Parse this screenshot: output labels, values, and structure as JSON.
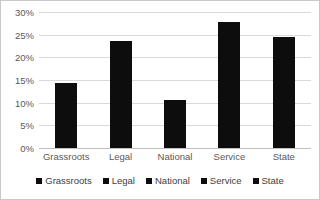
{
  "chart_data": {
    "type": "bar",
    "title": "",
    "xlabel": "",
    "ylabel": "",
    "categories": [
      "Grassroots",
      "Legal",
      "National",
      "Service",
      "State"
    ],
    "values": [
      14.3,
      23.5,
      10.5,
      27.8,
      24.5
    ],
    "ylim": [
      0,
      30
    ],
    "ytick_values": [
      0,
      5,
      10,
      15,
      20,
      25,
      30
    ],
    "ytick_labels": [
      "0%",
      "5%",
      "10%",
      "15%",
      "20%",
      "25%",
      "30%"
    ],
    "grid": true,
    "legend_position": "bottom",
    "legend": [
      {
        "label": "Grassroots",
        "color": "#0d0d0d"
      },
      {
        "label": "Legal",
        "color": "#0d0d0d"
      },
      {
        "label": "National",
        "color": "#0d0d0d"
      },
      {
        "label": "Service",
        "color": "#0d0d0d"
      },
      {
        "label": "State",
        "color": "#0d0d0d"
      }
    ],
    "series": [
      {
        "name": "Share",
        "values": [
          14.3,
          23.5,
          10.5,
          27.8,
          24.5
        ]
      }
    ],
    "colors": {
      "bar": "#0d0d0d",
      "gridline": "#d9d9d9",
      "axis": "#c0c0c0",
      "tick_text": "#595959",
      "legend_text": "#404040",
      "border": "#c8c8c8",
      "background": "#ffffff"
    }
  }
}
